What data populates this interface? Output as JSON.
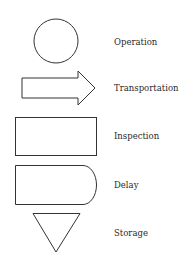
{
  "diagram": {
    "type": "process flow chart symbols legend",
    "colors": {
      "stroke": "#333333",
      "text": "#2a2a2a",
      "background": "#ffffff"
    },
    "symbols": [
      {
        "shape": "circle",
        "label": "Operation"
      },
      {
        "shape": "block-arrow",
        "label": "Transportation"
      },
      {
        "shape": "rectangle",
        "label": "Inspection"
      },
      {
        "shape": "d-shape",
        "label": "Delay"
      },
      {
        "shape": "inverted-triangle",
        "label": "Storage"
      }
    ]
  }
}
